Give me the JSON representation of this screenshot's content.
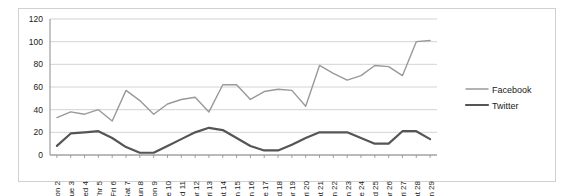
{
  "chart_data": {
    "type": "line",
    "title": "",
    "xlabel": "",
    "ylabel": "",
    "ylim": [
      0,
      120
    ],
    "yticks": [
      0,
      20,
      40,
      60,
      80,
      100,
      120
    ],
    "grid": "horizontal",
    "legend_position": "right",
    "categories": [
      "Mon 2",
      "Tue 3",
      "Wed 4",
      "Thr 5",
      "Fri 6",
      "Sat 7",
      "Sun 8",
      "Mon 9",
      "Tue 10",
      "Wed 11",
      "Thr 12",
      "Fri 13",
      "Sat 14",
      "Sun 15",
      "Mon 16",
      "Tue 17",
      "Wed 18",
      "Thr 19",
      "Fri 20",
      "Sat 21",
      "Sun 22",
      "Mon 23",
      "Tue 24",
      "Wed 25",
      "Thr 26",
      "Fri 27",
      "Sat 28",
      "Sun 29"
    ],
    "series": [
      {
        "name": "Facebook",
        "color": "#999999",
        "width": 1.4,
        "values": [
          33,
          38,
          36,
          40,
          30,
          57,
          48,
          36,
          45,
          49,
          51,
          38,
          62,
          62,
          49,
          56,
          58,
          57,
          43,
          79,
          72,
          66,
          70,
          79,
          78,
          70,
          100,
          101
        ]
      },
      {
        "name": "Twitter",
        "color": "#555555",
        "width": 2.2,
        "values": [
          8,
          19,
          20,
          21,
          15,
          7,
          2,
          2,
          8,
          14,
          20,
          24,
          22,
          15,
          8,
          4,
          4,
          9,
          15,
          20,
          20,
          20,
          15,
          10,
          10,
          21,
          21,
          14
        ]
      }
    ]
  },
  "legend": {
    "items": [
      {
        "label": "Facebook"
      },
      {
        "label": "Twitter"
      }
    ]
  }
}
